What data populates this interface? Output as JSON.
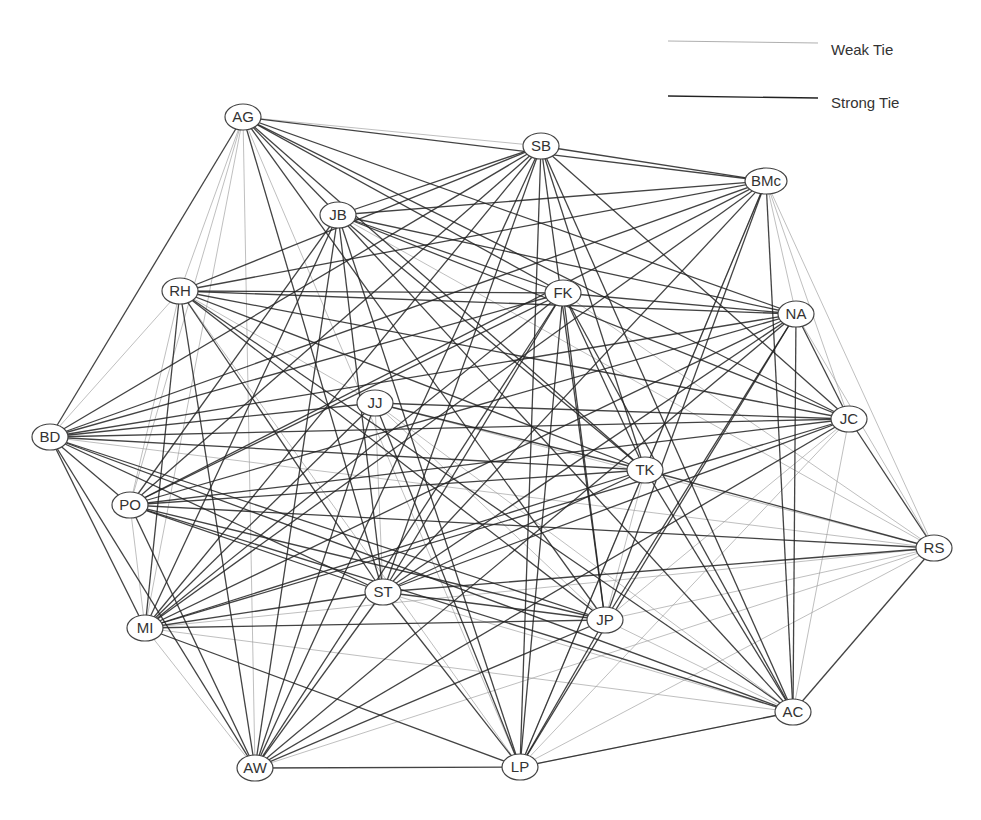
{
  "legend": {
    "weak": {
      "label": "Weak Tie",
      "color": "#9a9a9a",
      "width": 0.8
    },
    "strong": {
      "label": "Strong Tie",
      "color": "#222222",
      "width": 1.3
    }
  },
  "nodes": [
    {
      "id": "AG",
      "x": 243,
      "y": 117
    },
    {
      "id": "SB",
      "x": 541,
      "y": 146
    },
    {
      "id": "BMc",
      "x": 766,
      "y": 181
    },
    {
      "id": "JB",
      "x": 338,
      "y": 215
    },
    {
      "id": "RH",
      "x": 180,
      "y": 291
    },
    {
      "id": "FK",
      "x": 563,
      "y": 293
    },
    {
      "id": "NA",
      "x": 796,
      "y": 314
    },
    {
      "id": "JJ",
      "x": 375,
      "y": 403
    },
    {
      "id": "JC",
      "x": 849,
      "y": 419
    },
    {
      "id": "BD",
      "x": 50,
      "y": 437
    },
    {
      "id": "TK",
      "x": 645,
      "y": 470
    },
    {
      "id": "PO",
      "x": 130,
      "y": 505
    },
    {
      "id": "RS",
      "x": 934,
      "y": 548
    },
    {
      "id": "ST",
      "x": 383,
      "y": 592
    },
    {
      "id": "MI",
      "x": 145,
      "y": 628
    },
    {
      "id": "JP",
      "x": 605,
      "y": 620
    },
    {
      "id": "AC",
      "x": 793,
      "y": 712
    },
    {
      "id": "AW",
      "x": 255,
      "y": 768
    },
    {
      "id": "LP",
      "x": 520,
      "y": 767
    }
  ],
  "edges": {
    "strong": [
      [
        "AG",
        "JB"
      ],
      [
        "AG",
        "FK"
      ],
      [
        "AG",
        "NA"
      ],
      [
        "AG",
        "JC"
      ],
      [
        "AG",
        "TK"
      ],
      [
        "AG",
        "BD"
      ],
      [
        "AG",
        "ST"
      ],
      [
        "AG",
        "JP"
      ],
      [
        "AG",
        "BMc"
      ],
      [
        "SB",
        "BMc"
      ],
      [
        "SB",
        "JB"
      ],
      [
        "SB",
        "RH"
      ],
      [
        "SB",
        "BD"
      ],
      [
        "SB",
        "PO"
      ],
      [
        "SB",
        "MI"
      ],
      [
        "SB",
        "ST"
      ],
      [
        "SB",
        "LP"
      ],
      [
        "SB",
        "JP"
      ],
      [
        "SB",
        "TK"
      ],
      [
        "SB",
        "AC"
      ],
      [
        "SB",
        "AW"
      ],
      [
        "SB",
        "JC"
      ],
      [
        "BMc",
        "JB"
      ],
      [
        "BMc",
        "RH"
      ],
      [
        "BMc",
        "BD"
      ],
      [
        "BMc",
        "PO"
      ],
      [
        "BMc",
        "ST"
      ],
      [
        "BMc",
        "JP"
      ],
      [
        "BMc",
        "MI"
      ],
      [
        "BMc",
        "TK"
      ],
      [
        "BMc",
        "AC"
      ],
      [
        "JB",
        "FK"
      ],
      [
        "JB",
        "NA"
      ],
      [
        "JB",
        "JC"
      ],
      [
        "JB",
        "TK"
      ],
      [
        "JB",
        "ST"
      ],
      [
        "JB",
        "MI"
      ],
      [
        "JB",
        "AW"
      ],
      [
        "JB",
        "PO"
      ],
      [
        "JB",
        "LP"
      ],
      [
        "JB",
        "AC"
      ],
      [
        "RH",
        "FK"
      ],
      [
        "RH",
        "NA"
      ],
      [
        "RH",
        "JC"
      ],
      [
        "RH",
        "TK"
      ],
      [
        "RH",
        "ST"
      ],
      [
        "RH",
        "MI"
      ],
      [
        "RH",
        "JP"
      ],
      [
        "RH",
        "AW"
      ],
      [
        "RH",
        "AC"
      ],
      [
        "FK",
        "BD"
      ],
      [
        "FK",
        "PO"
      ],
      [
        "FK",
        "MI"
      ],
      [
        "FK",
        "ST"
      ],
      [
        "FK",
        "JP"
      ],
      [
        "FK",
        "LP"
      ],
      [
        "FK",
        "AC"
      ],
      [
        "FK",
        "AW"
      ],
      [
        "FK",
        "TK"
      ],
      [
        "FK",
        "NA"
      ],
      [
        "NA",
        "BD"
      ],
      [
        "NA",
        "PO"
      ],
      [
        "NA",
        "ST"
      ],
      [
        "NA",
        "JP"
      ],
      [
        "NA",
        "LP"
      ],
      [
        "NA",
        "MI"
      ],
      [
        "NA",
        "AC"
      ],
      [
        "NA",
        "JC"
      ],
      [
        "NA",
        "AW"
      ],
      [
        "JJ",
        "BD"
      ],
      [
        "JJ",
        "JC"
      ],
      [
        "JJ",
        "LP"
      ],
      [
        "JJ",
        "AW"
      ],
      [
        "JJ",
        "TK"
      ],
      [
        "JJ",
        "MI"
      ],
      [
        "JC",
        "BD"
      ],
      [
        "JC",
        "PO"
      ],
      [
        "JC",
        "ST"
      ],
      [
        "JC",
        "MI"
      ],
      [
        "JC",
        "AW"
      ],
      [
        "JC",
        "RS"
      ],
      [
        "BD",
        "TK"
      ],
      [
        "BD",
        "ST"
      ],
      [
        "BD",
        "JP"
      ],
      [
        "BD",
        "AC"
      ],
      [
        "BD",
        "MI"
      ],
      [
        "BD",
        "AW"
      ],
      [
        "BD",
        "PO"
      ],
      [
        "TK",
        "PO"
      ],
      [
        "TK",
        "MI"
      ],
      [
        "TK",
        "AC"
      ],
      [
        "TK",
        "ST"
      ],
      [
        "TK",
        "RS"
      ],
      [
        "TK",
        "LP"
      ],
      [
        "PO",
        "ST"
      ],
      [
        "PO",
        "JP"
      ],
      [
        "PO",
        "AC"
      ],
      [
        "PO",
        "AW"
      ],
      [
        "PO",
        "RS"
      ],
      [
        "ST",
        "JP"
      ],
      [
        "ST",
        "MI"
      ],
      [
        "ST",
        "AW"
      ],
      [
        "ST",
        "LP"
      ],
      [
        "ST",
        "RS"
      ],
      [
        "MI",
        "JP"
      ],
      [
        "MI",
        "LP"
      ],
      [
        "JP",
        "AW"
      ],
      [
        "JP",
        "LP"
      ],
      [
        "AC",
        "RS"
      ],
      [
        "AC",
        "LP"
      ],
      [
        "AW",
        "LP"
      ]
    ],
    "weak": [
      [
        "AG",
        "SB"
      ],
      [
        "AG",
        "RH"
      ],
      [
        "AG",
        "PO"
      ],
      [
        "AG",
        "MI"
      ],
      [
        "AG",
        "AW"
      ],
      [
        "AG",
        "LP"
      ],
      [
        "BMc",
        "NA"
      ],
      [
        "BMc",
        "JC"
      ],
      [
        "BMc",
        "RS"
      ],
      [
        "BMc",
        "LP"
      ],
      [
        "RH",
        "BD"
      ],
      [
        "RH",
        "PO"
      ],
      [
        "RH",
        "JJ"
      ],
      [
        "RH",
        "LP"
      ],
      [
        "JJ",
        "JP"
      ],
      [
        "JJ",
        "RS"
      ],
      [
        "JJ",
        "AC"
      ],
      [
        "JJ",
        "ST"
      ],
      [
        "JC",
        "JP"
      ],
      [
        "JC",
        "LP"
      ],
      [
        "JC",
        "AC"
      ],
      [
        "NA",
        "RS"
      ],
      [
        "FK",
        "RS"
      ],
      [
        "RS",
        "JP"
      ],
      [
        "RS",
        "MI"
      ],
      [
        "RS",
        "LP"
      ],
      [
        "RS",
        "AW"
      ],
      [
        "MI",
        "AC"
      ],
      [
        "MI",
        "AW"
      ],
      [
        "JP",
        "AC"
      ],
      [
        "ST",
        "AC"
      ],
      [
        "AW",
        "LP2"
      ],
      [
        "LP",
        "AC"
      ],
      [
        "TK",
        "JP"
      ],
      [
        "JB",
        "RS"
      ],
      [
        "BD",
        "RS"
      ],
      [
        "PO",
        "MI"
      ]
    ]
  }
}
